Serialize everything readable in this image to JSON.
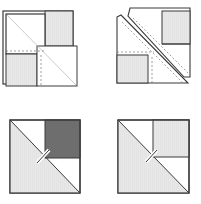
{
  "diagram": {
    "panels": [
      {
        "id": "step-1",
        "description": "Two squares layered with diagonal and dashed seam lines"
      },
      {
        "id": "step-2",
        "description": "Squares cut along diagonal with dashed seam allowances"
      },
      {
        "id": "step-3",
        "description": "Half-square triangle pinned with dark square corner"
      },
      {
        "id": "step-4",
        "description": "Half-square triangle pinned with light square corner"
      }
    ],
    "colors": {
      "outline": "#3a3a3a",
      "light_fill": "#e6e6e6",
      "dark_fill": "#6e6e6e",
      "medium_fill": "#dcdcdc",
      "white": "#ffffff",
      "diagonal": "#bdbdbd"
    }
  }
}
